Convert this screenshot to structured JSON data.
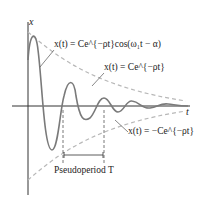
{
  "diagram": {
    "axis_x_label": "t",
    "axis_y_label": "x",
    "labels": {
      "oscillation": "x(t) = Ce^{−ρt}cos(ω₁t − α)",
      "upper_envelope": "x(t) = Ce^{−ρt}",
      "lower_envelope": "x(t) = −Ce^{−ρt}",
      "pseudoperiod": "Pseudoperiod T"
    },
    "colors": {
      "curve": "#7a7a7a",
      "envelope": "#b0b0b0",
      "axis": "#333333",
      "text": "#222222"
    }
  }
}
